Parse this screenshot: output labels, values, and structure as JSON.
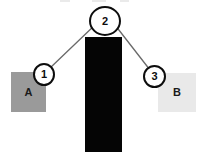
{
  "diagram": {
    "title": "",
    "canvas": {
      "width": 206,
      "height": 159,
      "background": "#ffffff"
    },
    "boxes": [
      {
        "id": "box-a",
        "label": "A",
        "fill": "#9a9a9a",
        "x": 11,
        "y": 72,
        "width": 35,
        "height": 40
      },
      {
        "id": "box-b",
        "label": "B",
        "fill": "#e9e9e9",
        "x": 158,
        "y": 73,
        "width": 38,
        "height": 39
      }
    ],
    "bar": {
      "id": "center-bar",
      "label": "",
      "fill": "#050505",
      "x": 85,
      "y": 37,
      "width": 37,
      "height": 115
    },
    "callouts": [
      {
        "id": "callout-1",
        "label": "1",
        "x": 33,
        "y": 63,
        "width": 22,
        "height": 23,
        "stroke": "#0d0d0d",
        "fill": "#ffffff"
      },
      {
        "id": "callout-2",
        "label": "2",
        "x": 89,
        "y": 6,
        "width": 32,
        "height": 30,
        "stroke": "#0d0d0d",
        "fill": "#ffffff"
      },
      {
        "id": "callout-3",
        "label": "3",
        "x": 143,
        "y": 65,
        "width": 23,
        "height": 23,
        "stroke": "#0d0d0d",
        "fill": "#ffffff"
      }
    ],
    "connectors": [
      {
        "id": "connector-1-2",
        "from": "callout-1",
        "to": "callout-2",
        "x1": 50,
        "y1": 68,
        "x2": 96,
        "y2": 24,
        "stroke": "#6a6a6a",
        "width": 1.3
      },
      {
        "id": "connector-2-3",
        "from": "callout-2",
        "to": "callout-3",
        "x1": 115,
        "y1": 25,
        "x2": 150,
        "y2": 70,
        "stroke": "#6a6a6a",
        "width": 1.3
      }
    ],
    "artifacts": [
      {
        "id": "top-mark-left",
        "x": 60,
        "y": 0,
        "width": 10,
        "height": 2
      },
      {
        "id": "top-mark-mid",
        "x": 92,
        "y": 0,
        "width": 14,
        "height": 2
      },
      {
        "id": "top-mark-right",
        "x": 120,
        "y": 0,
        "width": 9,
        "height": 2
      }
    ]
  }
}
